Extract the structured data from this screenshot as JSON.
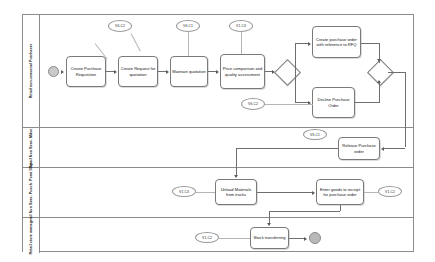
{
  "diagram": {
    "type": "bpmn-process-diagram",
    "pool": {
      "lanes": [
        {
          "id": "purchaser",
          "label": "Retail non-seasonal Purchaser"
        },
        {
          "id": "non-seas-mdse",
          "label": "Retail Non Seas. Mdse."
        },
        {
          "id": "goods-recv",
          "label": "Retail Non Seas. Pusch. Pomt Disp."
        },
        {
          "id": "store-manager",
          "label": "Retail store manager"
        }
      ]
    },
    "events": [
      {
        "id": "start",
        "kind": "start",
        "lane": "purchaser"
      },
      {
        "id": "end",
        "kind": "end",
        "lane": "store-manager"
      }
    ],
    "tasks": [
      {
        "id": "t1",
        "lane": "purchaser",
        "label": "Create Purchase Requisition"
      },
      {
        "id": "t2",
        "lane": "purchaser",
        "label": "Create Request for quotation"
      },
      {
        "id": "t3",
        "lane": "purchaser",
        "label": "Maintain quotation"
      },
      {
        "id": "t4",
        "lane": "purchaser",
        "label": "Price comparison and quality assessment"
      },
      {
        "id": "t5",
        "lane": "purchaser",
        "label": "Create purchase order with reference to RFQ"
      },
      {
        "id": "t6",
        "lane": "purchaser",
        "label": "Decline Purchase Order"
      },
      {
        "id": "t7",
        "lane": "non-seas-mdse",
        "label": "Release Purchase order"
      },
      {
        "id": "t8",
        "lane": "goods-recv",
        "label": "Unload Materials from trucks"
      },
      {
        "id": "t9",
        "lane": "goods-recv",
        "label": "Enter goods to receipt for purchase order"
      },
      {
        "id": "t10",
        "lane": "store-manager",
        "label": "Stock transferring"
      }
    ],
    "gateways": [
      {
        "id": "g1",
        "kind": "exclusive",
        "lane": "purchaser"
      },
      {
        "id": "g2",
        "kind": "exclusive",
        "lane": "purchaser"
      }
    ],
    "annotations": [
      {
        "id": "a1",
        "label": "V6.C2",
        "target": "t1"
      },
      {
        "id": "a2",
        "label": "V6.C1",
        "target": "t3"
      },
      {
        "id": "a3",
        "label": "V1.C3",
        "target": "t4"
      },
      {
        "id": "a4",
        "label": "V6.C2",
        "target": "t6"
      },
      {
        "id": "a5",
        "label": "V6.C1",
        "target": "t7"
      },
      {
        "id": "a6",
        "label": "V1.C3",
        "target": "t8"
      },
      {
        "id": "a7",
        "label": "V1.C2",
        "target": "t9"
      },
      {
        "id": "a8",
        "label": "V1.C2",
        "target": "t10"
      }
    ]
  }
}
